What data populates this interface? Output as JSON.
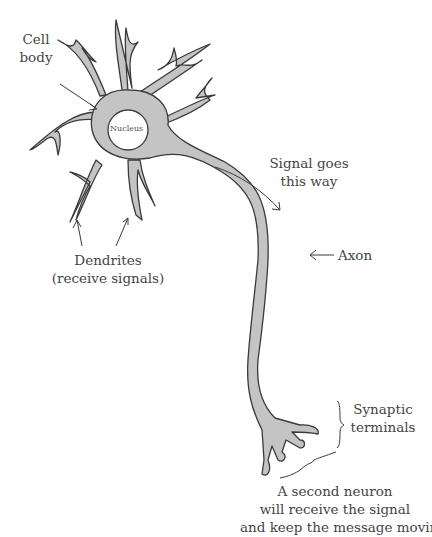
{
  "diagram": {
    "subject": "Neuron",
    "colors": {
      "cell_fill": "#c4c4c4",
      "outline": "#3a3a3a",
      "nucleus_fill": "#ffffff",
      "text": "#444444"
    },
    "labels": {
      "cell_body": {
        "line1": "Cell",
        "line2": "body"
      },
      "nucleus": "Nucleus",
      "dendrites": {
        "line1": "Dendrites",
        "line2": "(receive signals)"
      },
      "signal": {
        "line1": "Signal goes",
        "line2": "this way"
      },
      "axon": "Axon",
      "synaptic_terminals": {
        "line1": "Synaptic",
        "line2": "terminals"
      },
      "second_neuron": {
        "line1": "A second neuron",
        "line2": "will receive the signal",
        "line3": "and keep the message moving!"
      }
    }
  }
}
